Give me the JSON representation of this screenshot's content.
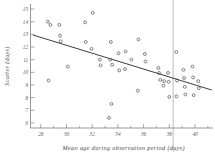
{
  "chart_data": {
    "type": "scatter",
    "title": "",
    "xlabel": "Mean age during observation period (days)",
    "ylabel": "Scatter (days)",
    "xlim": [
      27.2,
      41.4
    ],
    "ylim": [
      5.6,
      15.4
    ],
    "grid": false,
    "legend": null,
    "xticks": [
      28,
      30,
      32,
      34,
      36,
      38,
      40
    ],
    "xtick_labels": [
      "28",
      "30",
      "32",
      "34",
      "36",
      "38",
      "40"
    ],
    "x_minor_ticks": [
      29,
      31,
      33,
      35,
      37,
      39,
      41
    ],
    "yticks": [
      6,
      7,
      8,
      9,
      10,
      11,
      12,
      13,
      14,
      15
    ],
    "ytick_labels": [
      "6",
      "7",
      "8",
      "9",
      "10",
      "11",
      "12",
      "13",
      "14",
      "15"
    ],
    "points": [
      {
        "x": 28.55,
        "y": 14.0
      },
      {
        "x": 28.75,
        "y": 13.75
      },
      {
        "x": 29.45,
        "y": 13.75
      },
      {
        "x": 29.5,
        "y": 12.9
      },
      {
        "x": 29.55,
        "y": 12.45
      },
      {
        "x": 28.6,
        "y": 9.35
      },
      {
        "x": 30.1,
        "y": 10.45
      },
      {
        "x": 31.45,
        "y": 13.95
      },
      {
        "x": 31.5,
        "y": 12.4
      },
      {
        "x": 32.05,
        "y": 14.7
      },
      {
        "x": 31.95,
        "y": 11.85
      },
      {
        "x": 32.6,
        "y": 11.0
      },
      {
        "x": 32.65,
        "y": 10.55
      },
      {
        "x": 33.45,
        "y": 12.4
      },
      {
        "x": 33.4,
        "y": 11.0
      },
      {
        "x": 33.55,
        "y": 10.6
      },
      {
        "x": 33.5,
        "y": 7.5
      },
      {
        "x": 33.3,
        "y": 6.4
      },
      {
        "x": 34.05,
        "y": 11.5
      },
      {
        "x": 34.1,
        "y": 10.15
      },
      {
        "x": 34.6,
        "y": 11.65
      },
      {
        "x": 34.55,
        "y": 10.25
      },
      {
        "x": 35.05,
        "y": 11.0
      },
      {
        "x": 35.6,
        "y": 12.6
      },
      {
        "x": 35.55,
        "y": 8.55
      },
      {
        "x": 36.1,
        "y": 11.45
      },
      {
        "x": 36.15,
        "y": 10.85
      },
      {
        "x": 37.15,
        "y": 10.35
      },
      {
        "x": 37.2,
        "y": 9.95
      },
      {
        "x": 37.3,
        "y": 9.4
      },
      {
        "x": 37.6,
        "y": 9.3
      },
      {
        "x": 37.55,
        "y": 8.95
      },
      {
        "x": 37.9,
        "y": 9.95
      },
      {
        "x": 37.95,
        "y": 9.25
      },
      {
        "x": 38.0,
        "y": 8.05
      },
      {
        "x": 38.55,
        "y": 11.6
      },
      {
        "x": 38.6,
        "y": 9.35
      },
      {
        "x": 38.55,
        "y": 8.1
      },
      {
        "x": 39.1,
        "y": 10.2
      },
      {
        "x": 39.15,
        "y": 9.55
      },
      {
        "x": 39.2,
        "y": 8.85
      },
      {
        "x": 39.25,
        "y": 8.25
      },
      {
        "x": 39.8,
        "y": 10.45
      },
      {
        "x": 39.85,
        "y": 9.6
      },
      {
        "x": 39.9,
        "y": 8.2
      },
      {
        "x": 40.25,
        "y": 9.3
      },
      {
        "x": 40.3,
        "y": 8.75
      }
    ],
    "fit_line": {
      "x0": 27.4,
      "y0": 12.95,
      "x1": 41.3,
      "y1": 8.6
    },
    "reference_line": {
      "type": "vertical",
      "x": 38.3
    }
  }
}
